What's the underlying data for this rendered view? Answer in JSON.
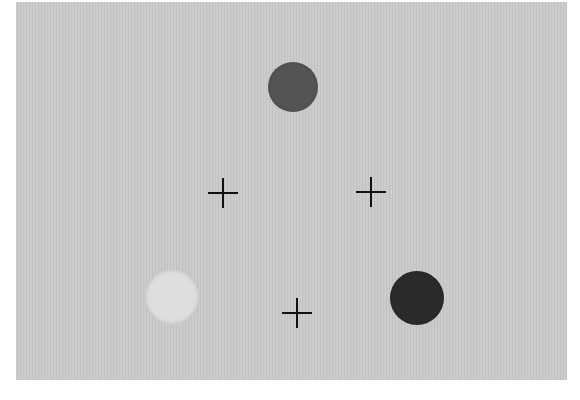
{
  "scene": {
    "background": "#c9c9c9",
    "stimuli": [
      {
        "id": "top",
        "shape": "circle",
        "cx": 293,
        "cy": 87,
        "r": 25,
        "color": "#545454"
      },
      {
        "id": "bottom-left",
        "shape": "circle",
        "cx": 172,
        "cy": 297,
        "r": 27,
        "color": "#dedede"
      },
      {
        "id": "bottom-right",
        "shape": "circle",
        "cx": 417,
        "cy": 298,
        "r": 27,
        "color": "#2b2b2b"
      }
    ],
    "fixation_crosses": [
      {
        "cx": 223,
        "cy": 193
      },
      {
        "cx": 371,
        "cy": 192
      },
      {
        "cx": 297,
        "cy": 313
      }
    ]
  }
}
